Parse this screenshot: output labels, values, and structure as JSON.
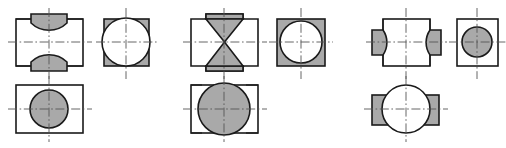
{
  "document": {
    "kind": "engineering-drawing",
    "title": "Orthographic projection exercise",
    "width": 506,
    "height": 148,
    "background_color": "#ffffff"
  },
  "style": {
    "outline_color": "#1a1a1a",
    "hatch_fill_color": "#a9a9a9",
    "void_fill_color": "#ffffff",
    "centerline_color": "#555555",
    "outline_width": 1.6,
    "centerline_width": 0.9
  },
  "groups": [
    {
      "id": "group-1",
      "label": "Problem 1",
      "views": [
        {
          "id": "g1-front",
          "name": "front-view",
          "description": "Rectangle with shaded saddle tabs above and below, concave inner arcs",
          "rect": {
            "x": 16,
            "y": 19,
            "w": 67,
            "h": 47
          },
          "features": [
            "top-saddle-tab",
            "bottom-saddle-tab"
          ],
          "fill": "hatch"
        },
        {
          "id": "g1-side",
          "name": "side-view",
          "description": "Square with shaded top and bottom bands, large white circle overlapping",
          "rect": {
            "x": 104,
            "y": 19,
            "w": 45,
            "h": 47
          },
          "circle": {
            "cx": 126,
            "cy": 42,
            "r": 24
          },
          "fill": "hatch-with-white-circle"
        },
        {
          "id": "g1-top",
          "name": "top-view",
          "description": "Rectangle with shaded circle inside",
          "rect": {
            "x": 16,
            "y": 85,
            "w": 67,
            "h": 48
          },
          "circle": {
            "cx": 49,
            "cy": 109,
            "r": 19
          },
          "fill": "hatch-circle"
        }
      ],
      "centerlines": {
        "front_h": {
          "x1": 8,
          "y1": 42,
          "x2": 92,
          "y2": 42
        },
        "front_v": {
          "x1": 49,
          "y1": 8,
          "x2": 49,
          "y2": 79
        },
        "side_h": {
          "x1": 96,
          "y1": 42,
          "x2": 158,
          "y2": 42
        },
        "side_v": {
          "x1": 126,
          "y1": 8,
          "x2": 126,
          "y2": 79
        },
        "top_h": {
          "x1": 8,
          "y1": 109,
          "x2": 92,
          "y2": 109
        },
        "top_v": {
          "x1": 49,
          "y1": 76,
          "x2": 49,
          "y2": 142
        }
      }
    },
    {
      "id": "group-2",
      "label": "Problem 2",
      "views": [
        {
          "id": "g2-front",
          "name": "front-view",
          "description": "Cross-shaped outline with shaded bowtie/hourglass of two triangles meeting at center",
          "rect": {
            "x": 191,
            "y": 19,
            "w": 67,
            "h": 47
          },
          "features": [
            "top-band",
            "bottom-band",
            "bowtie"
          ],
          "fill": "hatch"
        },
        {
          "id": "g2-side",
          "name": "side-view",
          "description": "Fully shaded square with inscribed white circle",
          "rect": {
            "x": 277,
            "y": 19,
            "w": 48,
            "h": 47
          },
          "circle": {
            "cx": 301,
            "cy": 42,
            "r": 21
          },
          "fill": "hatch-with-white-circle"
        },
        {
          "id": "g2-top",
          "name": "top-view",
          "description": "Rectangle with large shaded circle extending past top and bottom edges",
          "rect": {
            "x": 191,
            "y": 85,
            "w": 67,
            "h": 48
          },
          "circle": {
            "cx": 224,
            "cy": 109,
            "r": 26
          },
          "fill": "hatch-circle-overflow"
        }
      ],
      "centerlines": {
        "front_h": {
          "x1": 183,
          "y1": 42,
          "x2": 267,
          "y2": 42
        },
        "front_v": {
          "x1": 224,
          "y1": 8,
          "x2": 224,
          "y2": 79
        },
        "side_h": {
          "x1": 269,
          "y1": 42,
          "x2": 333,
          "y2": 42
        },
        "side_v": {
          "x1": 301,
          "y1": 8,
          "x2": 301,
          "y2": 79
        },
        "top_h": {
          "x1": 183,
          "y1": 109,
          "x2": 267,
          "y2": 109
        },
        "top_v": {
          "x1": 224,
          "y1": 76,
          "x2": 224,
          "y2": 142
        }
      }
    },
    {
      "id": "group-3",
      "label": "Problem 3",
      "views": [
        {
          "id": "g3-front",
          "name": "front-view",
          "description": "Rectangle with shaded side tabs left and right, convex inner arcs",
          "rect": {
            "x": 383,
            "y": 19,
            "w": 47,
            "h": 47
          },
          "features": [
            "left-side-tab",
            "right-side-tab"
          ],
          "fill": "hatch"
        },
        {
          "id": "g3-side",
          "name": "side-view",
          "description": "Square with shaded circle inside",
          "rect": {
            "x": 457,
            "y": 19,
            "w": 41,
            "h": 47
          },
          "circle": {
            "cx": 477,
            "cy": 42,
            "r": 15
          },
          "fill": "hatch-circle"
        },
        {
          "id": "g3-top",
          "name": "top-view",
          "description": "Wide shaded rectangle with large white circle overlapping the middle",
          "rect": {
            "x": 372,
            "y": 95,
            "w": 67,
            "h": 30
          },
          "circle": {
            "cx": 406,
            "cy": 109,
            "r": 24
          },
          "fill": "hatch-with-white-circle"
        }
      ],
      "centerlines": {
        "front_h": {
          "x1": 366,
          "y1": 42,
          "x2": 447,
          "y2": 42
        },
        "front_v": {
          "x1": 406,
          "y1": 8,
          "x2": 406,
          "y2": 79
        },
        "side_h": {
          "x1": 449,
          "y1": 42,
          "x2": 506,
          "y2": 42
        },
        "side_v": {
          "x1": 477,
          "y1": 8,
          "x2": 477,
          "y2": 79
        },
        "top_h": {
          "x1": 364,
          "y1": 109,
          "x2": 448,
          "y2": 109
        },
        "top_v": {
          "x1": 406,
          "y1": 76,
          "x2": 406,
          "y2": 142
        }
      }
    }
  ]
}
